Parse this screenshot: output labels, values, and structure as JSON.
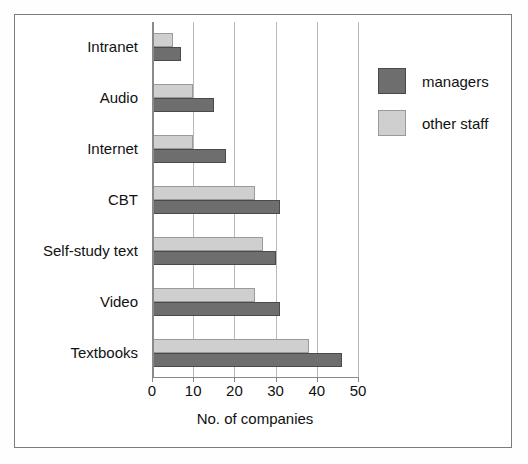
{
  "chart_data": {
    "type": "bar",
    "orientation": "horizontal",
    "title": "",
    "xlabel": "No. of companies",
    "ylabel": "",
    "xlim": [
      0,
      50
    ],
    "xticks": [
      0,
      10,
      20,
      30,
      40,
      50
    ],
    "xtick_labels": [
      "0",
      "10",
      "20",
      "30",
      "40",
      "50"
    ],
    "grid": "vertical",
    "legend_position": "right",
    "categories": [
      "Intranet",
      "Audio",
      "Internet",
      "CBT",
      "Self-study text",
      "Video",
      "Textbooks"
    ],
    "series": [
      {
        "name": "managers",
        "color": "#6e6e6e",
        "values": [
          7,
          15,
          18,
          31,
          30,
          31,
          46
        ]
      },
      {
        "name": "other staff",
        "color": "#cfcfcf",
        "values": [
          5,
          10,
          10,
          25,
          27,
          25,
          38
        ]
      }
    ]
  },
  "legend": {
    "items": [
      {
        "label": "managers",
        "color": "#6e6e6e"
      },
      {
        "label": "other staff",
        "color": "#cfcfcf"
      }
    ]
  },
  "colors": {
    "managers": "#6e6e6e",
    "other_staff": "#cfcfcf",
    "gridline": "#b9b9b9",
    "axis": "#8a8a8a",
    "frame": "#7c7c7c",
    "background": "#ffffff"
  }
}
